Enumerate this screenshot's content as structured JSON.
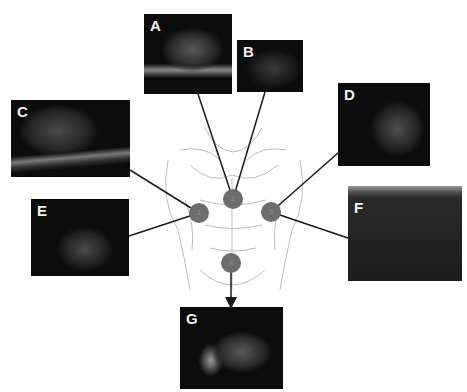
{
  "figure": {
    "panels": [
      {
        "id": "A",
        "label": "A",
        "x": 144,
        "y": 14,
        "w": 88,
        "h": 80
      },
      {
        "id": "B",
        "label": "B",
        "x": 237,
        "y": 40,
        "w": 66,
        "h": 52
      },
      {
        "id": "C",
        "label": "C",
        "x": 11,
        "y": 100,
        "w": 119,
        "h": 77
      },
      {
        "id": "D",
        "label": "D",
        "x": 338,
        "y": 83,
        "w": 92,
        "h": 83
      },
      {
        "id": "E",
        "label": "E",
        "x": 31,
        "y": 199,
        "w": 98,
        "h": 77
      },
      {
        "id": "F",
        "label": "F",
        "x": 348,
        "y": 186,
        "w": 114,
        "h": 95
      },
      {
        "id": "G",
        "label": "G",
        "x": 180,
        "y": 307,
        "w": 103,
        "h": 82
      }
    ],
    "probe_positions": [
      {
        "id": "1",
        "label": "1",
        "x": 199,
        "y": 213
      },
      {
        "id": "2",
        "label": "2",
        "x": 233,
        "y": 199
      },
      {
        "id": "3",
        "label": "3",
        "x": 271,
        "y": 212
      },
      {
        "id": "4",
        "label": "4",
        "x": 231,
        "y": 263
      }
    ],
    "connections": [
      {
        "from": "2",
        "to": "A"
      },
      {
        "from": "2",
        "to": "B"
      },
      {
        "from": "1",
        "to": "C"
      },
      {
        "from": "1",
        "to": "E"
      },
      {
        "from": "3",
        "to": "D"
      },
      {
        "from": "3",
        "to": "F"
      },
      {
        "from": "4",
        "to": "G",
        "arrow": true
      }
    ],
    "colors": {
      "line": "#1a1a1a",
      "circle": "#6d6d6d",
      "panel_bg": "#0c0c0c",
      "label": "#f2f2f2"
    }
  }
}
